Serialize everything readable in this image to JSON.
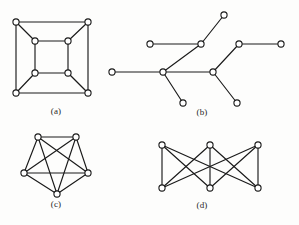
{
  "figure": {
    "background_color": "#fdfdfc",
    "stroke_color": "#1a1a1a",
    "node_fill_color": "#ffffff",
    "node_radius": 3.1,
    "panels": [
      {
        "id": "a",
        "label": "(a)",
        "name": "cube-graph-q3",
        "description": "Cube graph: outer square and inner square with corresponding corners joined",
        "vertex_count": 8,
        "edge_count": 12,
        "nodes": [
          {
            "id": "o1",
            "x": 16,
            "y": 22
          },
          {
            "id": "o2",
            "x": 88,
            "y": 22
          },
          {
            "id": "o3",
            "x": 88,
            "y": 93
          },
          {
            "id": "o4",
            "x": 16,
            "y": 93
          },
          {
            "id": "i1",
            "x": 35,
            "y": 41
          },
          {
            "id": "i2",
            "x": 68,
            "y": 41
          },
          {
            "id": "i3",
            "x": 68,
            "y": 73
          },
          {
            "id": "i4",
            "x": 35,
            "y": 73
          }
        ],
        "edges": [
          [
            "o1",
            "o2"
          ],
          [
            "o2",
            "o3"
          ],
          [
            "o3",
            "o4"
          ],
          [
            "o4",
            "o1"
          ],
          [
            "i1",
            "i2"
          ],
          [
            "i2",
            "i3"
          ],
          [
            "i3",
            "i4"
          ],
          [
            "i4",
            "i1"
          ],
          [
            "o1",
            "i1"
          ],
          [
            "o2",
            "i2"
          ],
          [
            "o3",
            "i3"
          ],
          [
            "o4",
            "i4"
          ]
        ]
      },
      {
        "id": "b",
        "label": "(b)",
        "name": "tree-graph",
        "description": "Tree with two internal hub vertices and six leaves",
        "vertex_count": 10,
        "edge_count": 9,
        "nodes": [
          {
            "id": "t1",
            "x": 112,
            "y": 72
          },
          {
            "id": "t2",
            "x": 163,
            "y": 72
          },
          {
            "id": "t3",
            "x": 201,
            "y": 44
          },
          {
            "id": "t4",
            "x": 150,
            "y": 44
          },
          {
            "id": "t5",
            "x": 224,
            "y": 15
          },
          {
            "id": "t6",
            "x": 183,
            "y": 103
          },
          {
            "id": "t7",
            "x": 213,
            "y": 72
          },
          {
            "id": "t8",
            "x": 239,
            "y": 44
          },
          {
            "id": "t9",
            "x": 281,
            "y": 44
          },
          {
            "id": "t10",
            "x": 237,
            "y": 103
          }
        ],
        "edges": [
          [
            "t1",
            "t2"
          ],
          [
            "t2",
            "t3"
          ],
          [
            "t3",
            "t4"
          ],
          [
            "t3",
            "t5"
          ],
          [
            "t2",
            "t6"
          ],
          [
            "t2",
            "t7"
          ],
          [
            "t7",
            "t8"
          ],
          [
            "t8",
            "t9"
          ],
          [
            "t7",
            "t10"
          ]
        ]
      },
      {
        "id": "c",
        "label": "(c)",
        "name": "complete-graph-k5",
        "description": "Complete graph on five vertices drawn as a pentagon with all diagonals",
        "vertex_count": 5,
        "edge_count": 10,
        "nodes": [
          {
            "id": "p1",
            "x": 38,
            "y": 137
          },
          {
            "id": "p2",
            "x": 76,
            "y": 137
          },
          {
            "id": "p3",
            "x": 88,
            "y": 173
          },
          {
            "id": "p4",
            "x": 57,
            "y": 194
          },
          {
            "id": "p5",
            "x": 24,
            "y": 173
          }
        ],
        "edges": [
          [
            "p1",
            "p2"
          ],
          [
            "p2",
            "p3"
          ],
          [
            "p3",
            "p4"
          ],
          [
            "p4",
            "p5"
          ],
          [
            "p5",
            "p1"
          ],
          [
            "p1",
            "p3"
          ],
          [
            "p1",
            "p4"
          ],
          [
            "p2",
            "p4"
          ],
          [
            "p2",
            "p5"
          ],
          [
            "p3",
            "p5"
          ]
        ]
      },
      {
        "id": "d",
        "label": "(d)",
        "name": "complete-bipartite-graph-k33",
        "description": "Complete bipartite graph K3,3: three top vertices each joined to three bottom vertices",
        "vertex_count": 6,
        "edge_count": 9,
        "nodes": [
          {
            "id": "u1",
            "x": 162,
            "y": 145
          },
          {
            "id": "u2",
            "x": 210,
            "y": 145
          },
          {
            "id": "u3",
            "x": 258,
            "y": 145
          },
          {
            "id": "v1",
            "x": 162,
            "y": 188
          },
          {
            "id": "v2",
            "x": 210,
            "y": 188
          },
          {
            "id": "v3",
            "x": 258,
            "y": 188
          }
        ],
        "edges": [
          [
            "u1",
            "v1"
          ],
          [
            "u1",
            "v2"
          ],
          [
            "u1",
            "v3"
          ],
          [
            "u2",
            "v1"
          ],
          [
            "u2",
            "v2"
          ],
          [
            "u2",
            "v3"
          ],
          [
            "u3",
            "v1"
          ],
          [
            "u3",
            "v2"
          ],
          [
            "u3",
            "v3"
          ]
        ]
      }
    ]
  }
}
